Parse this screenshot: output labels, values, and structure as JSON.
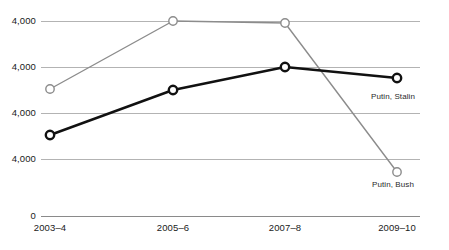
{
  "chart_data": {
    "type": "line",
    "title": "",
    "xlabel": "",
    "ylabel": "",
    "grid": true,
    "legend_position": "inline-right",
    "categories": [
      "2003–4",
      "2005–6",
      "2007–8",
      "2009–10"
    ],
    "y_tick_labels": [
      "4,000",
      "4,000",
      "4,000",
      "4,000",
      "0"
    ],
    "y_tick_pixels": [
      21,
      67,
      113,
      159,
      216
    ],
    "series": [
      {
        "name": "Putin, Bush",
        "color": "#8c8c8c",
        "line_width": 1.4,
        "marker": "open-circle",
        "values": [
          2520,
          4000,
          3960,
          860
        ],
        "pixel_y": [
          89,
          21,
          23,
          172
        ]
      },
      {
        "name": "Putin, Stalin",
        "color": "#111111",
        "line_width": 2.4,
        "marker": "open-circle",
        "values": [
          1520,
          2520,
          3180,
          2980
        ],
        "pixel_y": [
          135,
          90,
          67,
          78
        ]
      }
    ],
    "x_pixels": [
      50,
      173,
      285,
      397
    ],
    "annotations": [
      {
        "text": "Putin, Stalin",
        "x": 393,
        "y": 92
      },
      {
        "text": "Putin, Bush",
        "x": 393,
        "y": 180
      }
    ],
    "colors": {
      "gridline": "#b3b3b3",
      "axis": "#8a8a8a",
      "marker_fill": "#ffffff",
      "text": "#1a1a1a"
    }
  }
}
